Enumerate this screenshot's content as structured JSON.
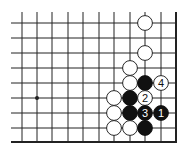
{
  "diagram": {
    "type": "go-board-fragment",
    "corner": "bottom-right",
    "grid": {
      "columns_x": [
        22,
        37,
        52,
        68,
        83,
        99,
        114,
        130,
        145,
        161,
        176
      ],
      "rows_y": [
        23,
        38,
        53,
        68,
        83,
        98,
        113,
        128,
        142
      ],
      "left_open_x": 11,
      "top_open_y": 12,
      "right_edge_col": 10,
      "bottom_edge_row": 8
    },
    "star_points": [
      {
        "col": 1,
        "row": 5
      }
    ],
    "stones": [
      {
        "col": 8,
        "row": 0,
        "color": "white",
        "label": ""
      },
      {
        "col": 8,
        "row": 2,
        "color": "white",
        "label": ""
      },
      {
        "col": 7,
        "row": 3,
        "color": "white",
        "label": ""
      },
      {
        "col": 7,
        "row": 4,
        "color": "white",
        "label": ""
      },
      {
        "col": 8,
        "row": 4,
        "color": "black",
        "label": ""
      },
      {
        "col": 9,
        "row": 4,
        "color": "white",
        "label": "4"
      },
      {
        "col": 6,
        "row": 5,
        "color": "white",
        "label": ""
      },
      {
        "col": 7,
        "row": 5,
        "color": "black",
        "label": ""
      },
      {
        "col": 8,
        "row": 5,
        "color": "white",
        "label": "2"
      },
      {
        "col": 6,
        "row": 6,
        "color": "white",
        "label": ""
      },
      {
        "col": 7,
        "row": 6,
        "color": "black",
        "label": ""
      },
      {
        "col": 8,
        "row": 6,
        "color": "black",
        "label": "3"
      },
      {
        "col": 9,
        "row": 6,
        "color": "black",
        "label": "1"
      },
      {
        "col": 6,
        "row": 7,
        "color": "white",
        "label": ""
      },
      {
        "col": 7,
        "row": 7,
        "color": "white",
        "label": ""
      },
      {
        "col": 8,
        "row": 7,
        "color": "black",
        "label": ""
      }
    ],
    "colors": {
      "line": "#222222",
      "black_stone": "#111111",
      "white_stone": "#ffffff",
      "stone_outline": "#111111"
    }
  }
}
